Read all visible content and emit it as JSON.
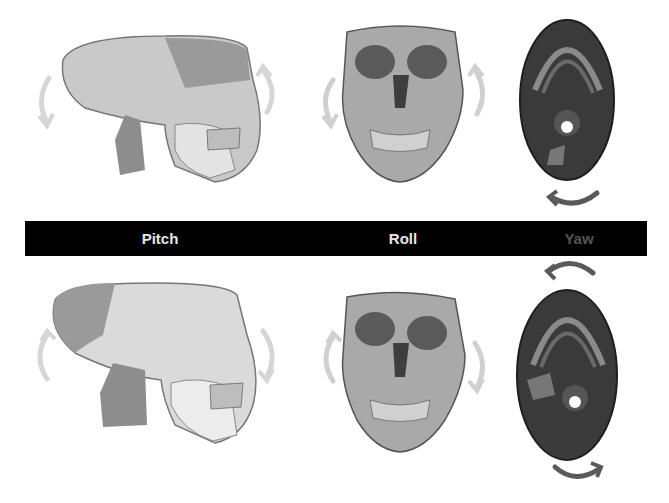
{
  "labels": {
    "pitch": "Pitch",
    "roll": "Roll",
    "yaw": "Yaw"
  },
  "colors": {
    "bar": "#000000",
    "pitch_label": "#e6e6e6",
    "roll_label": "#e6e6e6",
    "yaw_label": "#555555",
    "arrow_light": "#d0d0d0",
    "arrow_dark": "#5a5a5a"
  },
  "rows": [
    {
      "name": "top-row",
      "views": [
        "lateral-skull",
        "frontal-skull",
        "inferior-skull"
      ]
    },
    {
      "name": "bottom-row",
      "views": [
        "lateral-skull",
        "frontal-skull",
        "inferior-skull"
      ]
    }
  ]
}
